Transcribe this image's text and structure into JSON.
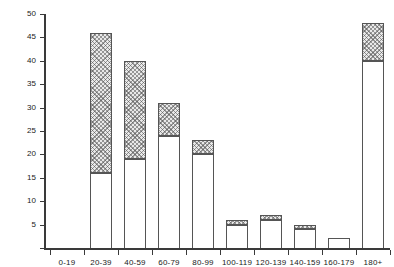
{
  "chart_data": {
    "type": "bar",
    "stacked": true,
    "title": "",
    "subtitle": "",
    "xlabel": "",
    "ylabel": "NUMBER OF PATIENTS",
    "categories": [
      "0-19",
      "20-39",
      "40-59",
      "60-79",
      "80-99",
      "100-119",
      "120-139",
      "140-159",
      "160-179",
      "180+"
    ],
    "series": [
      {
        "name": "lower-open",
        "fill": "white",
        "values": [
          0,
          16,
          19,
          24,
          20,
          5,
          6,
          4,
          2,
          40
        ]
      },
      {
        "name": "upper-hatched",
        "fill": "hatched",
        "values": [
          0,
          30,
          21,
          7,
          3,
          1,
          1,
          1,
          0,
          8
        ]
      }
    ],
    "totals": [
      0,
      46,
      40,
      31,
      23,
      6,
      7,
      5,
      2,
      48
    ],
    "ylim": [
      0,
      50
    ],
    "yticks": [
      0,
      5,
      10,
      15,
      20,
      25,
      30,
      35,
      40,
      45,
      50
    ],
    "ytick_labels": [
      "",
      "5",
      "10",
      "15",
      "20",
      "25",
      "30",
      "35",
      "40",
      "45",
      "50"
    ],
    "grid": false,
    "legend": "none"
  },
  "axis": {
    "y_title": "NUMBER OF PATIENTS"
  }
}
